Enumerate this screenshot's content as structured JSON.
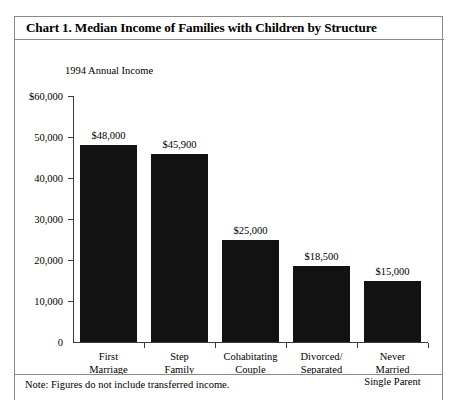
{
  "figure": {
    "title": "Chart 1. Median Income of Families with Children by Structure",
    "axis_caption": "1994 Annual Income",
    "footnote": "Note: Figures do not include transferred income."
  },
  "chart_data": {
    "type": "bar",
    "title": "Chart 1. Median Income of Families with Children by Structure",
    "subtitle": "1994 Annual Income",
    "categories": [
      "First Marriage",
      "Step Family",
      "Cohabitating Couple",
      "Divorced/ Separated",
      "Never Married Single Parent"
    ],
    "category_lines": [
      [
        "First",
        "Marriage"
      ],
      [
        "Step",
        "Family"
      ],
      [
        "Cohabitating",
        "Couple"
      ],
      [
        "Divorced/",
        "Separated"
      ],
      [
        "Never",
        "Married",
        "Single Parent"
      ]
    ],
    "values": [
      48000,
      45900,
      25000,
      18500,
      15000
    ],
    "value_labels": [
      "$48,000",
      "$45,900",
      "$25,000",
      "$18,500",
      "$15,000"
    ],
    "xlabel": "",
    "ylabel": "1994 Annual Income",
    "ylim": [
      0,
      60000
    ],
    "ytick_values": [
      60000,
      50000,
      40000,
      30000,
      20000,
      10000,
      0
    ],
    "ytick_labels": [
      "$60,000",
      "50,000",
      "40,000",
      "30,000",
      "20,000",
      "10,000",
      "0"
    ],
    "grid": false,
    "legend": null,
    "bar_color": "#121212",
    "annotations": [
      "Note: Figures do not include transferred income."
    ]
  }
}
